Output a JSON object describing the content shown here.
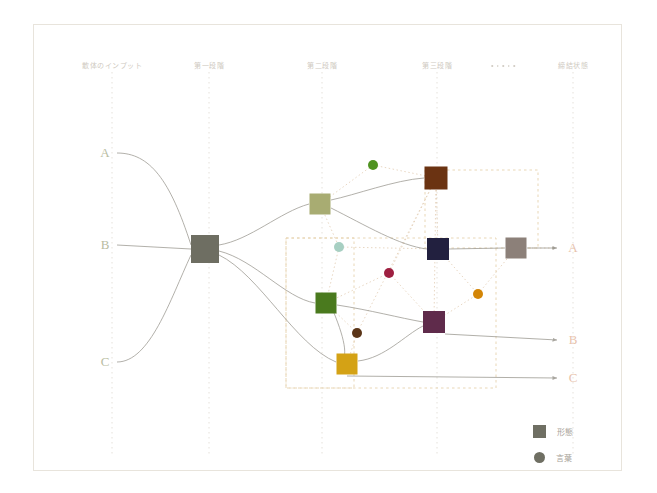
{
  "diagram": {
    "title_columns": [
      {
        "id": "input",
        "label": "散体のインプット",
        "x": 112,
        "y": 66,
        "guide": true
      },
      {
        "id": "stage1",
        "label": "第一段階",
        "x": 209,
        "y": 66,
        "guide": true
      },
      {
        "id": "stage2",
        "label": "第二段階",
        "x": 322,
        "y": 66,
        "guide": true
      },
      {
        "id": "stage3",
        "label": "第三段階",
        "x": 437,
        "y": 66,
        "guide": true
      },
      {
        "id": "ellipsis",
        "label": "· · · · ·",
        "x": 503,
        "y": 66,
        "guide": false
      },
      {
        "id": "output",
        "label": "締結状態",
        "x": 573,
        "y": 66,
        "guide": true
      }
    ],
    "guide_x": [
      112,
      209,
      322,
      437,
      573
    ],
    "guide_top": 72,
    "guide_bottom": 455,
    "inputs": [
      {
        "label": "A",
        "x": 105,
        "y": 153
      },
      {
        "label": "B",
        "x": 105,
        "y": 245
      },
      {
        "label": "C",
        "x": 105,
        "y": 362
      }
    ],
    "outputs": [
      {
        "label": "A",
        "x": 573,
        "y": 248
      },
      {
        "label": "B",
        "x": 573,
        "y": 340
      },
      {
        "label": "C",
        "x": 573,
        "y": 378
      }
    ],
    "nodes": [
      {
        "id": "hub",
        "shape": "square",
        "x": 205,
        "y": 249,
        "size": 28,
        "color": "#6e6e62"
      },
      {
        "id": "s1a",
        "shape": "square",
        "x": 320,
        "y": 204,
        "size": 21,
        "color": "#a8ac72"
      },
      {
        "id": "s1b",
        "shape": "square",
        "x": 326,
        "y": 303,
        "size": 21,
        "color": "#4a7a1e"
      },
      {
        "id": "s1c",
        "shape": "square",
        "x": 347,
        "y": 364,
        "size": 21,
        "color": "#d4a215"
      },
      {
        "id": "s2a",
        "shape": "square",
        "x": 436,
        "y": 178,
        "size": 23,
        "color": "#6b3312"
      },
      {
        "id": "s2b",
        "shape": "square",
        "x": 438,
        "y": 249,
        "size": 22,
        "color": "#22203f"
      },
      {
        "id": "s2c",
        "shape": "square",
        "x": 434,
        "y": 322,
        "size": 22,
        "color": "#5f2b4b"
      },
      {
        "id": "outsq",
        "shape": "square",
        "x": 516,
        "y": 248,
        "size": 21,
        "color": "#8c8079"
      },
      {
        "id": "c1",
        "shape": "circle",
        "x": 373,
        "y": 165,
        "size": 10,
        "color": "#4f9321"
      },
      {
        "id": "c2",
        "shape": "circle",
        "x": 339,
        "y": 247,
        "size": 10,
        "color": "#a7cfc2"
      },
      {
        "id": "c3",
        "shape": "circle",
        "x": 389,
        "y": 273,
        "size": 10,
        "color": "#9e1f40"
      },
      {
        "id": "c4",
        "shape": "circle",
        "x": 478,
        "y": 294,
        "size": 10,
        "color": "#d38506"
      },
      {
        "id": "c5",
        "shape": "circle",
        "x": 357,
        "y": 333,
        "size": 10,
        "color": "#5b3518"
      }
    ],
    "group_boxes": [
      {
        "id": "box-upper-right",
        "x": 425,
        "y": 170,
        "w": 113,
        "h": 78
      },
      {
        "id": "box-mid-left",
        "x": 286,
        "y": 238,
        "w": 210,
        "h": 150
      },
      {
        "id": "box-lower-left",
        "x": 286,
        "y": 238,
        "w": 68,
        "h": 150
      }
    ],
    "legend": {
      "items": [
        {
          "shape": "square",
          "label": "形態",
          "color": "#6f6f63"
        },
        {
          "shape": "circle",
          "label": "言葉",
          "color": "#6f6f63"
        }
      ]
    },
    "colors": {
      "frame_border": "#e8e4dc",
      "guide_line": "#ded9d0",
      "edge_solid": "#9a978f",
      "edge_dotted": "#e2cdb4",
      "group_box": "#e7d3ae",
      "input_label": "#b9bda2",
      "output_label": "#e8c3ad",
      "header_text": "#cfcac1",
      "legend_text": "#a9a49a",
      "background": "#ffffff"
    }
  }
}
